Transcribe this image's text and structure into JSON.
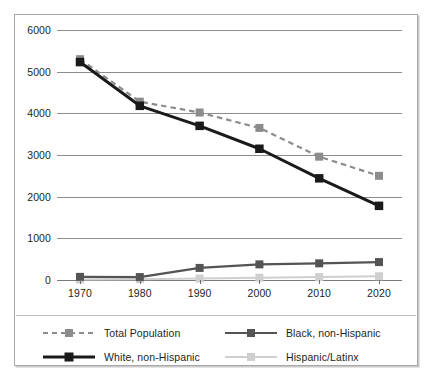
{
  "chart_data": {
    "type": "line",
    "title": "",
    "xlabel": "",
    "ylabel": "",
    "categories": [
      "1970",
      "1980",
      "1990",
      "2000",
      "2010",
      "2020"
    ],
    "x": [
      1970,
      1980,
      1990,
      2000,
      2010,
      2020
    ],
    "ylim": [
      0,
      6000
    ],
    "ytick_labels": [
      "0",
      "1000",
      "2000",
      "3000",
      "4000",
      "5000",
      "6000"
    ],
    "ytick_values": [
      0,
      1000,
      2000,
      3000,
      4000,
      5000,
      6000
    ],
    "grid": true,
    "legend_position": "bottom",
    "series": [
      {
        "name": "Total Population",
        "values": [
          5300,
          4280,
          4020,
          3650,
          2960,
          2500
        ],
        "color": "#8c8c8c",
        "line_style": "dashed",
        "line_width": 2.2,
        "marker": "square"
      },
      {
        "name": "White, non-Hispanic",
        "values": [
          5230,
          4180,
          3700,
          3150,
          2440,
          1780
        ],
        "color": "#1a1a1a",
        "line_style": "solid",
        "line_width": 3.0,
        "marker": "square"
      },
      {
        "name": "Black, non-Hispanic",
        "values": [
          75,
          70,
          290,
          375,
          400,
          430
        ],
        "color": "#545454",
        "line_style": "solid",
        "line_width": 2.2,
        "marker": "square"
      },
      {
        "name": "Hispanic/Latinx",
        "values": [
          15,
          18,
          35,
          55,
          70,
          90
        ],
        "color": "#cfcfcf",
        "line_style": "solid",
        "line_width": 2.0,
        "marker": "square"
      }
    ]
  },
  "legend": {
    "items": [
      {
        "label": "Total Population"
      },
      {
        "label": "Black, non-Hispanic"
      },
      {
        "label": "White, non-Hispanic"
      },
      {
        "label": "Hispanic/Latinx"
      }
    ]
  }
}
